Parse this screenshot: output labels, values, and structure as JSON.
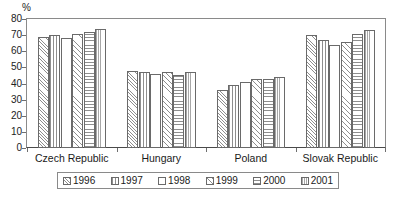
{
  "chart_data": {
    "type": "bar",
    "title": "",
    "subtitle": "",
    "xlabel": "",
    "ylabel": "%",
    "ylim": [
      0,
      80
    ],
    "yticks": [
      0,
      10,
      20,
      30,
      40,
      50,
      60,
      70,
      80
    ],
    "grid": false,
    "legend_position": "bottom",
    "categories": [
      "Czech Republic",
      "Hungary",
      "Poland",
      "Slovak Republic"
    ],
    "series": [
      {
        "name": "1996",
        "values": [
          69,
          48,
          36,
          70
        ]
      },
      {
        "name": "1997",
        "values": [
          70,
          47,
          39,
          67
        ]
      },
      {
        "name": "1998",
        "values": [
          68,
          46,
          41,
          64
        ]
      },
      {
        "name": "1999",
        "values": [
          71,
          47,
          43,
          66
        ]
      },
      {
        "name": "2000",
        "values": [
          72,
          45,
          43,
          71
        ]
      },
      {
        "name": "2001",
        "values": [
          74,
          47,
          44,
          73
        ]
      }
    ]
  },
  "axis": {
    "unit_label": "%",
    "y_tick_labels": [
      "80",
      "70",
      "60",
      "50",
      "40",
      "30",
      "20",
      "10",
      "0"
    ]
  },
  "categories": {
    "c0": "Czech Republic",
    "c1": "Hungary",
    "c2": "Poland",
    "c3": "Slovak Republic"
  },
  "legend": {
    "items": [
      {
        "label": "1996"
      },
      {
        "label": "1997"
      },
      {
        "label": "1998"
      },
      {
        "label": "1999"
      },
      {
        "label": "2000"
      },
      {
        "label": "2001"
      }
    ]
  }
}
